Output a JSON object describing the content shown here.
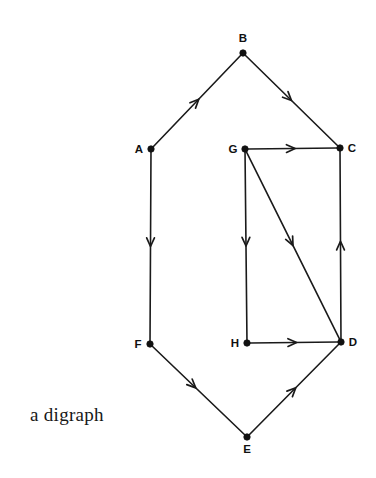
{
  "figure": {
    "caption": "a digraph",
    "caption_x": 30,
    "caption_y": 404,
    "width": 376,
    "height": 478,
    "background_color": "#ffffff",
    "ink_color": "#1a1a1a",
    "vertex_color": "#111111"
  },
  "chart_data": {
    "type": "diagram",
    "diagram_kind": "directed-graph",
    "title": "a digraph",
    "directed": true,
    "node_count": 8,
    "edge_count": 10,
    "nodes": [
      {
        "id": "A",
        "label": "A",
        "x": 151,
        "y": 149,
        "label_dx": -12,
        "label_dy": 4
      },
      {
        "id": "B",
        "label": "B",
        "x": 243,
        "y": 53,
        "label_dx": 0,
        "label_dy": -11
      },
      {
        "id": "C",
        "label": "C",
        "x": 340,
        "y": 148,
        "label_dx": 12,
        "label_dy": 4
      },
      {
        "id": "D",
        "label": "D",
        "x": 341,
        "y": 342,
        "label_dx": 12,
        "label_dy": 4
      },
      {
        "id": "E",
        "label": "E",
        "x": 247,
        "y": 437,
        "label_dx": 0,
        "label_dy": 16
      },
      {
        "id": "F",
        "label": "F",
        "x": 150,
        "y": 344,
        "label_dx": -12,
        "label_dy": 4
      },
      {
        "id": "G",
        "label": "G",
        "x": 245,
        "y": 149,
        "label_dx": -12,
        "label_dy": 4
      },
      {
        "id": "H",
        "label": "H",
        "x": 247,
        "y": 343,
        "label_dx": -12,
        "label_dy": 4
      }
    ],
    "edges": [
      {
        "from": "A",
        "to": "B",
        "arrow_at": 0.52,
        "name": "edge-a-b"
      },
      {
        "from": "B",
        "to": "C",
        "arrow_at": 0.5,
        "name": "edge-b-c"
      },
      {
        "from": "A",
        "to": "F",
        "arrow_at": 0.5,
        "name": "edge-a-f"
      },
      {
        "from": "F",
        "to": "E",
        "arrow_at": 0.47,
        "name": "edge-f-e"
      },
      {
        "from": "E",
        "to": "D",
        "arrow_at": 0.52,
        "name": "edge-e-d"
      },
      {
        "from": "D",
        "to": "C",
        "arrow_at": 0.52,
        "name": "edge-d-c"
      },
      {
        "from": "G",
        "to": "C",
        "arrow_at": 0.53,
        "name": "edge-g-c"
      },
      {
        "from": "G",
        "to": "H",
        "arrow_at": 0.5,
        "name": "edge-g-h"
      },
      {
        "from": "G",
        "to": "D",
        "arrow_at": 0.5,
        "name": "edge-g-d"
      },
      {
        "from": "H",
        "to": "D",
        "arrow_at": 0.53,
        "name": "edge-h-d"
      }
    ]
  }
}
